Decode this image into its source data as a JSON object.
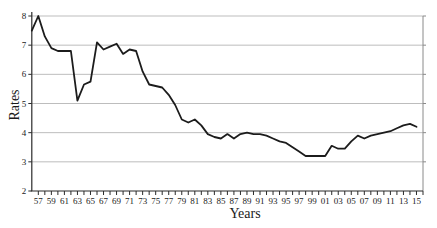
{
  "chart_data": {
    "type": "line",
    "title": "",
    "xlabel": "Years",
    "ylabel": "Rates",
    "x": [
      1956,
      1957,
      1958,
      1959,
      1960,
      1961,
      1962,
      1963,
      1964,
      1965,
      1966,
      1967,
      1968,
      1969,
      1970,
      1971,
      1972,
      1973,
      1974,
      1975,
      1976,
      1977,
      1978,
      1979,
      1980,
      1981,
      1982,
      1983,
      1984,
      1985,
      1986,
      1987,
      1988,
      1989,
      1990,
      1991,
      1992,
      1993,
      1994,
      1995,
      1996,
      1997,
      1998,
      1999,
      2000,
      2001,
      2002,
      2003,
      2004,
      2005,
      2006,
      2007,
      2008,
      2009,
      2010,
      2011,
      2012,
      2013,
      2014,
      2015
    ],
    "values": [
      7.5,
      8.0,
      7.3,
      6.9,
      6.8,
      6.8,
      6.8,
      5.1,
      5.65,
      5.75,
      7.1,
      6.85,
      6.95,
      7.05,
      6.7,
      6.85,
      6.8,
      6.1,
      5.65,
      5.6,
      5.55,
      5.3,
      4.95,
      4.45,
      4.35,
      4.45,
      4.25,
      3.95,
      3.85,
      3.8,
      3.95,
      3.8,
      3.95,
      4.0,
      3.95,
      3.95,
      3.9,
      3.8,
      3.7,
      3.65,
      3.5,
      3.35,
      3.2,
      3.2,
      3.2,
      3.2,
      3.55,
      3.45,
      3.45,
      3.7,
      3.9,
      3.8,
      3.9,
      3.95,
      4.0,
      4.05,
      4.15,
      4.25,
      4.3,
      4.2
    ],
    "x_tick_labels": [
      "57",
      "59",
      "61",
      "63",
      "65",
      "67",
      "69",
      "71",
      "73",
      "75",
      "77",
      "79",
      "81",
      "83",
      "85",
      "87",
      "89",
      "91",
      "93",
      "95",
      "97",
      "99",
      "01",
      "03",
      "05",
      "07",
      "09",
      "11",
      "13",
      "15"
    ],
    "x_axis": {
      "first_tick_year": 1957,
      "last_tick_year": 2016,
      "label_every_years": 2
    },
    "y_ticks": [
      "2",
      "3",
      "4",
      "5",
      "6",
      "7",
      "8"
    ],
    "ylim": [
      2,
      8
    ],
    "grid": "horizontal",
    "legend": false,
    "line_color": "#1c1c1c",
    "grid_color": "#bdbdbd",
    "axis_color": "#2b2b2b",
    "border_color": "#8a8a8a",
    "tick_label_color": "#1a1a1a"
  }
}
